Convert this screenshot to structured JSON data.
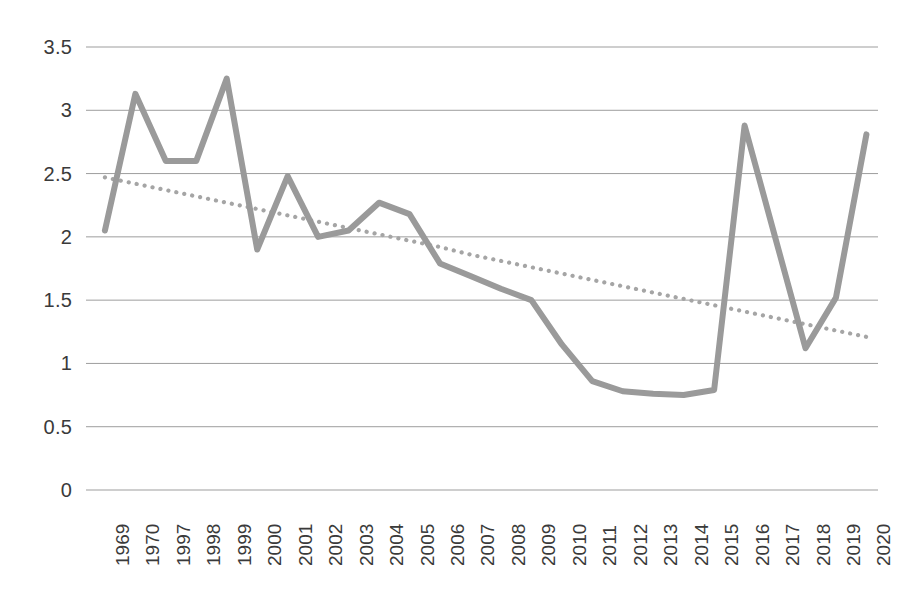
{
  "chart_data": {
    "type": "line",
    "title": "",
    "subtitle": "",
    "xlabel": "",
    "ylabel": "",
    "grid": true,
    "legend": "none",
    "ylim": [
      0,
      3.5
    ],
    "yticks": [
      "0",
      "0.5",
      "1",
      "1.5",
      "2",
      "2.5",
      "3",
      "3.5"
    ],
    "ytick_values": [
      0,
      0.5,
      1,
      1.5,
      2,
      2.5,
      3,
      3.5
    ],
    "categories": [
      "1969",
      "1970",
      "1997",
      "1998",
      "1999",
      "2000",
      "2001",
      "2002",
      "2003",
      "2004",
      "2005",
      "2006",
      "2007",
      "2008",
      "2009",
      "2010",
      "2011",
      "2012",
      "2013",
      "2014",
      "2015",
      "2016",
      "2017",
      "2018",
      "2019",
      "2020"
    ],
    "series": [
      {
        "name": "data-series",
        "style": "solid",
        "color": "#9a9a9a",
        "values": [
          2.05,
          3.13,
          2.6,
          2.6,
          3.25,
          1.9,
          2.48,
          2.0,
          2.05,
          2.27,
          2.18,
          1.79,
          1.69,
          1.59,
          1.5,
          1.15,
          0.86,
          0.78,
          0.76,
          0.75,
          0.79,
          2.88,
          2.0,
          1.12,
          1.52,
          2.81
        ]
      },
      {
        "name": "trendline",
        "style": "dotted",
        "color": "#a5a5a5",
        "values": [
          2.47,
          2.42,
          2.37,
          2.32,
          2.27,
          2.22,
          2.17,
          2.12,
          2.07,
          2.02,
          1.97,
          1.92,
          1.86,
          1.81,
          1.76,
          1.71,
          1.66,
          1.61,
          1.56,
          1.51,
          1.46,
          1.41,
          1.36,
          1.31,
          1.26,
          1.21
        ]
      }
    ]
  },
  "axes": {
    "y_tick_labels": [
      "3.5",
      "3",
      "2.5",
      "2",
      "1.5",
      "1",
      "0.5",
      "0"
    ],
    "x_tick_labels": [
      "1969",
      "1970",
      "1997",
      "1998",
      "1999",
      "2000",
      "2001",
      "2002",
      "2003",
      "2004",
      "2005",
      "2006",
      "2007",
      "2008",
      "2009",
      "2010",
      "2011",
      "2012",
      "2013",
      "2014",
      "2015",
      "2016",
      "2017",
      "2018",
      "2019",
      "2020"
    ]
  },
  "colors": {
    "series_line": "#9a9a9a",
    "trendline": "#a5a5a5",
    "gridline": "#9d9d9d",
    "tick_text": "#3a3a3a",
    "background": "#ffffff"
  }
}
